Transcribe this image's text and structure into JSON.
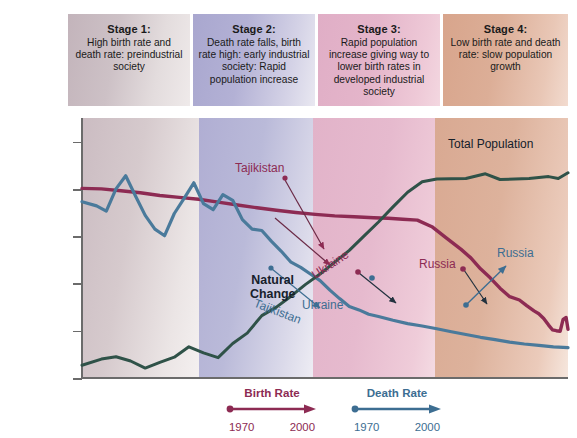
{
  "figure": {
    "stages": [
      {
        "id": "stage-1",
        "title": "Stage 1:",
        "desc": "High birth rate and death rate: preindustrial society"
      },
      {
        "id": "stage-2",
        "title": "Stage 2:",
        "desc": "Death rate falls, birth rate high: early industrial society: Rapid population increase"
      },
      {
        "id": "stage-3",
        "title": "Stage 3:",
        "desc": "Rapid population increase giving way to lower birth rates in developed industrial society"
      },
      {
        "id": "stage-4",
        "title": "Stage 4:",
        "desc": "Low birth rate and death rate: slow population growth"
      }
    ],
    "annotations": [
      {
        "id": "tajikistan-birth",
        "text": "Tajikistan",
        "color": "maroon"
      },
      {
        "id": "tajikistan-death",
        "text": "Tajikistan",
        "color": "blue"
      },
      {
        "id": "natural-change",
        "text": "Natural",
        "text2": "Change",
        "color": "dark"
      },
      {
        "id": "ukraine-birth",
        "text": "Ukraine",
        "color": "maroon"
      },
      {
        "id": "ukraine-death",
        "text": "Ukraine",
        "color": "blue"
      },
      {
        "id": "russia-birth",
        "text": "Russia",
        "color": "maroon"
      },
      {
        "id": "russia-death",
        "text": "Russia",
        "color": "blue"
      },
      {
        "id": "total-population",
        "text": "Total Population",
        "color": "dark"
      }
    ],
    "legend": [
      {
        "id": "birth-rate",
        "label": "Birth Rate",
        "start": "1970",
        "end": "2000",
        "color": "#8d2b53"
      },
      {
        "id": "death-rate",
        "label": "Death Rate",
        "start": "1970",
        "end": "2000",
        "color": "#3d6e92"
      }
    ]
  },
  "chart_data": {
    "type": "line",
    "xlabel": "",
    "ylabel": "Birth and death rates (per 1,000 of population per year)",
    "ylim": [
      0,
      55
    ],
    "yticks": [
      0,
      10,
      20,
      30,
      40,
      50
    ],
    "xlim": [
      0,
      100
    ],
    "grid": false,
    "legend_position": "bottom",
    "stage_boundaries": [
      0,
      24,
      47.5,
      72.6,
      100
    ],
    "series": [
      {
        "name": "Birth Rate",
        "color": "#8d2b53",
        "points": [
          [
            0,
            40.1
          ],
          [
            4,
            40.0
          ],
          [
            8,
            39.6
          ],
          [
            12,
            39.2
          ],
          [
            16,
            38.6
          ],
          [
            20,
            38.2
          ],
          [
            24,
            37.8
          ],
          [
            28,
            37.2
          ],
          [
            32,
            36.6
          ],
          [
            36,
            36.0
          ],
          [
            40,
            35.5
          ],
          [
            44,
            35.0
          ],
          [
            48,
            34.6
          ],
          [
            52,
            34.3
          ],
          [
            56,
            34.1
          ],
          [
            60,
            33.9
          ],
          [
            63,
            33.8
          ],
          [
            66,
            33.6
          ],
          [
            69,
            33.4
          ],
          [
            72,
            32.0
          ],
          [
            75,
            29.6
          ],
          [
            78,
            27.2
          ],
          [
            80,
            25.4
          ],
          [
            82,
            23.1
          ],
          [
            84,
            21.2
          ],
          [
            86,
            19.0
          ],
          [
            88,
            17.2
          ],
          [
            90,
            16.5
          ],
          [
            91.5,
            15.3
          ],
          [
            93,
            14.2
          ],
          [
            94,
            13.6
          ],
          [
            95,
            12.6
          ],
          [
            96,
            11.2
          ],
          [
            96.8,
            10.2
          ],
          [
            97.6,
            10.0
          ],
          [
            98.4,
            9.9
          ],
          [
            99,
            12.4
          ],
          [
            99.6,
            12.8
          ],
          [
            100,
            10.3
          ]
        ]
      },
      {
        "name": "Death Rate",
        "color": "#4a7a9b",
        "points": [
          [
            0,
            37.3
          ],
          [
            3,
            36.4
          ],
          [
            5,
            35.3
          ],
          [
            7,
            40.0
          ],
          [
            9,
            42.8
          ],
          [
            11,
            38.5
          ],
          [
            13,
            34.4
          ],
          [
            15,
            31.5
          ],
          [
            17,
            30.1
          ],
          [
            19,
            34.8
          ],
          [
            21,
            38.0
          ],
          [
            23,
            41.3
          ],
          [
            25,
            36.9
          ],
          [
            27,
            35.6
          ],
          [
            29,
            38.8
          ],
          [
            31,
            37.6
          ],
          [
            33,
            33.5
          ],
          [
            35,
            31.5
          ],
          [
            37,
            31.2
          ],
          [
            39,
            28.9
          ],
          [
            41,
            26.8
          ],
          [
            43,
            24.5
          ],
          [
            45,
            23.4
          ],
          [
            47,
            22.0
          ],
          [
            49,
            20.6
          ],
          [
            51,
            18.6
          ],
          [
            53,
            16.8
          ],
          [
            55,
            15.1
          ],
          [
            57,
            14.4
          ],
          [
            59,
            13.5
          ],
          [
            61,
            13.0
          ],
          [
            64,
            12.2
          ],
          [
            67,
            11.5
          ],
          [
            70,
            11.0
          ],
          [
            73,
            10.4
          ],
          [
            76,
            9.8
          ],
          [
            79,
            9.2
          ],
          [
            82,
            8.6
          ],
          [
            85,
            8.1
          ],
          [
            88,
            7.6
          ],
          [
            91,
            7.2
          ],
          [
            94,
            6.9
          ],
          [
            97,
            6.6
          ],
          [
            100,
            6.4
          ]
        ]
      },
      {
        "name": "Total Population",
        "color": "#2f5248",
        "points": [
          [
            0,
            2.7
          ],
          [
            4,
            4.0
          ],
          [
            7,
            4.5
          ],
          [
            10,
            3.6
          ],
          [
            13,
            2.1
          ],
          [
            16,
            3.3
          ],
          [
            19,
            4.4
          ],
          [
            22,
            6.6
          ],
          [
            25,
            5.3
          ],
          [
            28,
            4.3
          ],
          [
            31,
            7.3
          ],
          [
            34,
            9.5
          ],
          [
            37,
            13.2
          ],
          [
            40,
            15.0
          ],
          [
            43,
            17.3
          ],
          [
            46,
            19.8
          ],
          [
            49,
            22.0
          ],
          [
            52,
            24.5
          ],
          [
            55,
            27.0
          ],
          [
            58,
            30.0
          ],
          [
            61,
            33.0
          ],
          [
            64,
            36.2
          ],
          [
            67,
            39.3
          ],
          [
            70,
            41.5
          ],
          [
            73,
            42.1
          ],
          [
            79,
            42.2
          ],
          [
            83,
            43.2
          ],
          [
            86,
            42.0
          ],
          [
            92,
            42.2
          ],
          [
            96,
            42.6
          ],
          [
            98,
            42.2
          ],
          [
            100,
            43.4
          ]
        ]
      }
    ],
    "pointers": [
      {
        "from": "tajikistan-birth",
        "to_series": "Birth Rate",
        "style": "arrow"
      },
      {
        "from": "tajikistan-death",
        "to_series": "Death Rate",
        "style": "arrow"
      },
      {
        "from": "ukraine-birth",
        "to_series": "Birth Rate",
        "style": "arrow"
      },
      {
        "from": "ukraine-death",
        "to_series": "Death Rate",
        "style": "arrow"
      },
      {
        "from": "russia-birth",
        "to_series": "Birth Rate",
        "style": "arrow"
      },
      {
        "from": "russia-death",
        "to_series": "Death Rate",
        "style": "arrow"
      }
    ]
  }
}
